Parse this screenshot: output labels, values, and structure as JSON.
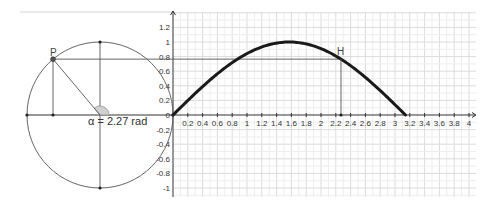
{
  "diagram": {
    "angle": {
      "symbol": "α",
      "value": 2.27,
      "unit": "rad",
      "label": "α = 2.27 rad"
    },
    "points": [
      {
        "name": "P",
        "label": "P",
        "on": "unit-circle"
      },
      {
        "name": "H",
        "label": "H",
        "on": "sine-curve"
      }
    ],
    "colors": {
      "curve": "#1a1a1a",
      "construction": "#555555",
      "grid_major": "#dcdcdc",
      "grid_minor": "#eeeeee",
      "axis": "#333333",
      "angle_fill": "#d0d0d0",
      "point": "#222222"
    }
  },
  "chart_data": {
    "type": "line",
    "title": "",
    "xlabel": "",
    "ylabel": "",
    "function": "y = sin(x)",
    "series": [
      {
        "name": "sin(x), 0 ≤ x ≤ π",
        "x": [
          0,
          0.2,
          0.4,
          0.6,
          0.8,
          1.0,
          1.2,
          1.4,
          1.5708,
          1.8,
          2.0,
          2.2,
          2.27,
          2.4,
          2.6,
          2.8,
          3.0,
          3.1416
        ],
        "y": [
          0,
          0.199,
          0.389,
          0.565,
          0.717,
          0.841,
          0.932,
          0.985,
          1.0,
          0.974,
          0.909,
          0.808,
          0.765,
          0.675,
          0.516,
          0.335,
          0.141,
          0
        ]
      }
    ],
    "highlight_point": {
      "name": "H",
      "x": 2.27,
      "y": 0.765
    },
    "x_ticks": [
      "0.2",
      "0.4",
      "0.6",
      "0.8",
      "1",
      "1.2",
      "1.4",
      "1.6",
      "1.8",
      "2",
      "2.2",
      "2.4",
      "2.6",
      "2.8",
      "3",
      "3.2",
      "3.4",
      "3.6",
      "3.8",
      "4"
    ],
    "y_ticks": [
      "1.2",
      "1",
      "0.8",
      "0.6",
      "0.4",
      "0.2",
      "0",
      "-0.2",
      "-0.4",
      "-0.6",
      "-0.8",
      "-1"
    ],
    "xlim": [
      0,
      4.05
    ],
    "ylim": [
      -1.1,
      1.4
    ],
    "grid": true,
    "legend": "none"
  }
}
